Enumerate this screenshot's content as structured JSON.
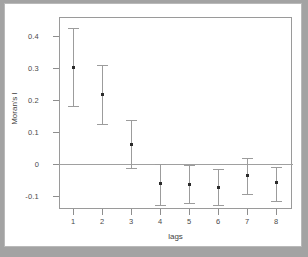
{
  "chart_data": {
    "type": "scatter",
    "title": "",
    "xlabel": "lags",
    "ylabel": "Moran's I",
    "x": [
      1,
      2,
      3,
      4,
      5,
      6,
      7,
      8
    ],
    "categories": [
      "1",
      "2",
      "3",
      "4",
      "5",
      "6",
      "7",
      "8"
    ],
    "values": [
      0.301,
      0.218,
      0.06,
      -0.06,
      -0.065,
      -0.072,
      -0.036,
      -0.059
    ],
    "error_upper": [
      0.425,
      0.31,
      0.137,
      0.0,
      -0.004,
      -0.015,
      0.018,
      -0.01
    ],
    "error_lower": [
      0.181,
      0.126,
      -0.012,
      -0.127,
      -0.123,
      -0.129,
      -0.093,
      -0.115
    ],
    "xlim": [
      0.5,
      8.5
    ],
    "ylim": [
      -0.145,
      0.452
    ],
    "xticks": [
      "1",
      "2",
      "3",
      "4",
      "5",
      "6",
      "7",
      "8"
    ],
    "yticks": [
      "0.4",
      "0.3",
      "0.2",
      "0.1",
      "0",
      "-0.1"
    ],
    "ytick_values": [
      0.4,
      0.3,
      0.2,
      0.1,
      0,
      -0.1
    ],
    "reference_line": 0,
    "grid": false,
    "legend": null,
    "marker": "square",
    "colors": {
      "point": "#2b2b2b",
      "whisker": "#9c9c9c",
      "axis": "#8e8e8e",
      "frame": "#9a9a9a",
      "background": "#ffffff",
      "page": "#a3a3a3",
      "text": "#4a4a4a"
    }
  }
}
